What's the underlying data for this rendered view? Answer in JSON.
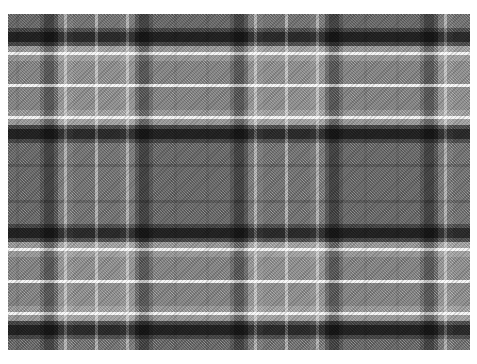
{
  "image": {
    "title": "Grayscale Tartan Plaid Fabric Swatch",
    "subject": "tartan-plaid-textile",
    "width_px": 477,
    "height_px": 364,
    "background_color": "#ffffff"
  },
  "swatch": {
    "left_px": 8,
    "top_px": 14,
    "width_px": 462,
    "height_px": 336,
    "base_color": "#7d7d7d",
    "weave": "twill",
    "weave_angle_deg": 45
  },
  "palette": {
    "base_gray": "#7d7d7d",
    "light_gray": "#8e8e8e",
    "mid_gray": "#747474",
    "dark_gray": "#5a5a5a",
    "deep_charcoal": "#3c3c3c",
    "near_black": "#1f1f1f",
    "white_line": "#eaeaea",
    "bright_white": "#f6f6f6"
  },
  "pattern": {
    "type": "tartan",
    "symmetry": "reflective-sett",
    "horizontal_repeat_px": 95,
    "vertical_repeat_px": 98,
    "description": "Grayscale balanced tartan sett with broad mid-gray grounds, paired charcoal bars, and thin white guard lines over a 45-degree twill weave."
  },
  "chart_data": {
    "type": "heatmap",
    "xlabel": "Warp position (px from swatch left)",
    "ylabel": "Weft position (px from swatch top)",
    "legend_position": "none",
    "grid": false,
    "xlim": [
      0,
      462
    ],
    "ylim": [
      0,
      336
    ],
    "warp_stripes": [
      {
        "start": 0,
        "width": 24,
        "color": "#7a7a7a",
        "name": "ground-mid"
      },
      {
        "start": 24,
        "width": 3,
        "color": "#6d6d6d",
        "name": "shadow-line"
      },
      {
        "start": 27,
        "width": 21,
        "color": "#7a7a7a",
        "name": "ground-mid"
      },
      {
        "start": 48,
        "width": 4,
        "color": "#5e5e5e",
        "name": "guard-dark"
      },
      {
        "start": 52,
        "width": 10,
        "color": "#3a3a3a",
        "name": "bar-charcoal"
      },
      {
        "start": 62,
        "width": 4,
        "color": "#5e5e5e",
        "name": "guard-dark"
      },
      {
        "start": 66,
        "width": 6,
        "color": "#9a9a9a",
        "name": "guard-light"
      },
      {
        "start": 72,
        "width": 3,
        "color": "#ededed",
        "name": "white-line"
      },
      {
        "start": 75,
        "width": 6,
        "color": "#9a9a9a",
        "name": "guard-light"
      },
      {
        "start": 81,
        "width": 22,
        "color": "#8c8c8c",
        "name": "ground-light"
      },
      {
        "start": 103,
        "width": 3,
        "color": "#ededed",
        "name": "white-line"
      },
      {
        "start": 106,
        "width": 22,
        "color": "#8c8c8c",
        "name": "ground-light"
      },
      {
        "start": 128,
        "width": 6,
        "color": "#9a9a9a",
        "name": "guard-light"
      },
      {
        "start": 134,
        "width": 3,
        "color": "#ededed",
        "name": "white-line"
      },
      {
        "start": 137,
        "width": 6,
        "color": "#9a9a9a",
        "name": "guard-light"
      },
      {
        "start": 143,
        "width": 4,
        "color": "#5e5e5e",
        "name": "guard-dark"
      },
      {
        "start": 147,
        "width": 10,
        "color": "#3a3a3a",
        "name": "bar-charcoal"
      },
      {
        "start": 157,
        "width": 4,
        "color": "#5e5e5e",
        "name": "guard-dark"
      },
      {
        "start": 161,
        "width": 21,
        "color": "#7a7a7a",
        "name": "ground-mid"
      },
      {
        "start": 182,
        "width": 3,
        "color": "#6d6d6d",
        "name": "shadow-line"
      },
      {
        "start": 185,
        "width": 24,
        "color": "#7a7a7a",
        "name": "ground-mid"
      }
    ],
    "weft_stripes": [
      {
        "start": 0,
        "width": 24,
        "color": "#7a7a7a",
        "name": "ground-mid"
      },
      {
        "start": 24,
        "width": 3,
        "color": "#6d6d6d",
        "name": "shadow-line"
      },
      {
        "start": 27,
        "width": 21,
        "color": "#7a7a7a",
        "name": "ground-mid"
      },
      {
        "start": 48,
        "width": 4,
        "color": "#5e5e5e",
        "name": "guard-dark"
      },
      {
        "start": 52,
        "width": 10,
        "color": "#3a3a3a",
        "name": "bar-charcoal"
      },
      {
        "start": 62,
        "width": 4,
        "color": "#5e5e5e",
        "name": "guard-dark"
      },
      {
        "start": 66,
        "width": 6,
        "color": "#9a9a9a",
        "name": "guard-light"
      },
      {
        "start": 72,
        "width": 3,
        "color": "#ededed",
        "name": "white-line"
      },
      {
        "start": 75,
        "width": 6,
        "color": "#9a9a9a",
        "name": "guard-light"
      },
      {
        "start": 81,
        "width": 23,
        "color": "#8c8c8c",
        "name": "ground-light"
      },
      {
        "start": 104,
        "width": 3,
        "color": "#ededed",
        "name": "white-line"
      },
      {
        "start": 107,
        "width": 23,
        "color": "#8c8c8c",
        "name": "ground-light"
      },
      {
        "start": 130,
        "width": 6,
        "color": "#9a9a9a",
        "name": "guard-light"
      },
      {
        "start": 136,
        "width": 3,
        "color": "#ededed",
        "name": "white-line"
      },
      {
        "start": 139,
        "width": 6,
        "color": "#9a9a9a",
        "name": "guard-light"
      },
      {
        "start": 145,
        "width": 4,
        "color": "#5e5e5e",
        "name": "guard-dark"
      },
      {
        "start": 149,
        "width": 10,
        "color": "#3a3a3a",
        "name": "bar-charcoal"
      },
      {
        "start": 159,
        "width": 4,
        "color": "#5e5e5e",
        "name": "guard-dark"
      },
      {
        "start": 163,
        "width": 21,
        "color": "#7a7a7a",
        "name": "ground-mid"
      },
      {
        "start": 184,
        "width": 3,
        "color": "#6d6d6d",
        "name": "shadow-line"
      },
      {
        "start": 187,
        "width": 24,
        "color": "#7a7a7a",
        "name": "ground-mid"
      }
    ],
    "warp_offset_px": -16,
    "weft_offset_px": -34,
    "intersection_note": "Charcoal warp over charcoal weft reads near-black (#1f1f1f); white warp over white weft reads bright white (#f6f6f6)."
  }
}
